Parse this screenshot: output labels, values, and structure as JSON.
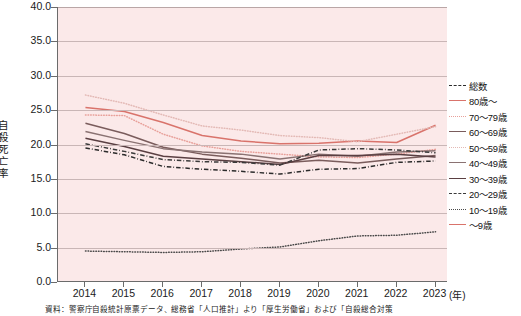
{
  "axes": {
    "y_title": "自殺死亡率",
    "y_ticks": [
      "40.0",
      "35.0",
      "30.0",
      "25.0",
      "20.0",
      "15.0",
      "10.0",
      "5.0",
      "0.0"
    ],
    "x_ticks": [
      "2014",
      "2015",
      "2016",
      "2017",
      "2018",
      "2019",
      "2020",
      "2021",
      "2022",
      "2023"
    ],
    "x_unit": "(年)"
  },
  "legend": [
    {
      "label": "総数",
      "key": "total",
      "color": "#2b2b2b",
      "style": "dashdot"
    },
    {
      "label": "80歳～",
      "key": "a80",
      "color": "#d9736b",
      "style": "solid"
    },
    {
      "label": "70～79歳",
      "key": "a70",
      "color": "#e8a09a",
      "style": "dotted"
    },
    {
      "label": "60～69歳",
      "key": "a60",
      "color": "#7a5c5c",
      "style": "solid"
    },
    {
      "label": "50～59歳",
      "key": "a50",
      "color": "#e3b9b5",
      "style": "dotted"
    },
    {
      "label": "40～49歳",
      "key": "a40",
      "color": "#8a7272",
      "style": "solid"
    },
    {
      "label": "30～39歳",
      "key": "a30",
      "color": "#5a3f42",
      "style": "solid"
    },
    {
      "label": "20～29歳",
      "key": "a20",
      "color": "#3a3a3a",
      "style": "dashdot"
    },
    {
      "label": "10～19歳",
      "key": "a10",
      "color": "#4a4a4a",
      "style": "dotted"
    },
    {
      "label": "～9歳",
      "key": "a09",
      "color": "#d9736b",
      "style": "solid"
    }
  ],
  "chart_data": {
    "type": "line",
    "title": "",
    "xlabel": "(年)",
    "ylabel": "自殺死亡率",
    "x": [
      2014,
      2015,
      2016,
      2017,
      2018,
      2019,
      2020,
      2021,
      2022,
      2023
    ],
    "ylim": [
      0,
      40
    ],
    "ytick_step": 5,
    "grid": true,
    "legend_position": "right",
    "series": [
      {
        "name": "総数",
        "color": "#2b2b2b",
        "style": "dashdot",
        "values": [
          19.5,
          18.5,
          16.8,
          16.4,
          16.1,
          15.7,
          16.4,
          16.5,
          17.4,
          17.6
        ]
      },
      {
        "name": "80歳～",
        "color": "#d9736b",
        "style": "solid",
        "values": [
          25.4,
          24.8,
          23.2,
          21.3,
          20.5,
          20.1,
          20.2,
          20.5,
          20.3,
          22.8
        ]
      },
      {
        "name": "70～79歳",
        "color": "#e8a09a",
        "style": "dotted",
        "values": [
          24.3,
          24.2,
          21.5,
          19.8,
          19.0,
          18.6,
          18.2,
          18.1,
          18.6,
          19.3
        ]
      },
      {
        "name": "60～69歳",
        "color": "#7a5c5c",
        "style": "solid",
        "values": [
          23.1,
          21.6,
          19.6,
          18.6,
          18.0,
          17.3,
          17.7,
          17.3,
          17.9,
          18.4
        ]
      },
      {
        "name": "50～59歳",
        "color": "#e3b9b5",
        "style": "dotted",
        "values": [
          27.2,
          26.0,
          24.3,
          22.7,
          22.1,
          21.3,
          21.0,
          20.4,
          21.5,
          22.6
        ]
      },
      {
        "name": "40～49歳",
        "color": "#8a7272",
        "style": "solid",
        "values": [
          21.9,
          20.6,
          19.4,
          18.9,
          18.6,
          17.9,
          18.6,
          18.3,
          18.9,
          19.1
        ]
      },
      {
        "name": "30～39歳",
        "color": "#5a3f42",
        "style": "solid",
        "values": [
          20.9,
          19.7,
          18.3,
          17.9,
          17.5,
          17.1,
          18.4,
          18.4,
          18.6,
          18.2
        ]
      },
      {
        "name": "20～29歳",
        "color": "#3a3a3a",
        "style": "dashdot",
        "values": [
          20.1,
          19.0,
          17.8,
          17.5,
          17.4,
          17.0,
          19.2,
          19.4,
          19.2,
          18.8
        ]
      },
      {
        "name": "10～19歳",
        "color": "#4a4a4a",
        "style": "dotted",
        "values": [
          4.5,
          4.4,
          4.3,
          4.4,
          4.8,
          5.1,
          6.0,
          6.7,
          6.8,
          7.3
        ]
      },
      {
        "name": "～9歳",
        "color": "#d9736b",
        "style": "solid",
        "values": [
          0,
          0,
          0,
          0,
          0,
          0,
          0,
          0,
          0,
          0
        ]
      }
    ]
  },
  "source_note": "資料：警察庁自殺統計原票データ、総務省「人口推計」より「厚生労働省」および「自殺総合対策"
}
